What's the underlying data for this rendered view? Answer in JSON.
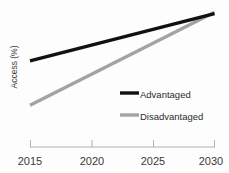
{
  "chart_data": {
    "type": "line",
    "title": "",
    "xlabel": "",
    "ylabel": "Access (%)",
    "xlim": [
      2015,
      2030
    ],
    "ylim": [
      0,
      100
    ],
    "xticks": [
      "2015",
      "2020",
      "2025",
      "2030"
    ],
    "grid": false,
    "legend_position": "center-right",
    "series": [
      {
        "name": "Advantaged",
        "color": "#111111",
        "x": [
          2015,
          2030
        ],
        "values": [
          62,
          96
        ]
      },
      {
        "name": "Disadvantaged",
        "color": "#a3a3a3",
        "x": [
          2015,
          2030
        ],
        "values": [
          30,
          97
        ]
      }
    ],
    "annotations": []
  },
  "axis": {
    "line_color": "#b0b0b0",
    "tick_color": "#b0b0b0"
  },
  "legend": {
    "items": [
      {
        "label": "Advantaged",
        "color": "#111111"
      },
      {
        "label": "Disadvantaged",
        "color": "#a3a3a3"
      }
    ]
  }
}
